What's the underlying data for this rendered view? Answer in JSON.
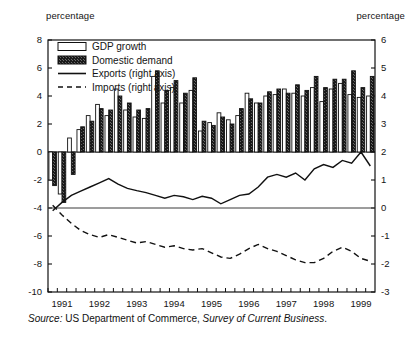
{
  "labels": {
    "unit_left": "percentage",
    "unit_right": "percentage",
    "source_prefix": "Source:",
    "source_body": " US Department of Commerce, ",
    "source_publication": "Survey of Current Business",
    "source_end": "."
  },
  "legend": {
    "items": [
      {
        "label": "GDP growth",
        "marker": "open-bar-swatch"
      },
      {
        "label": "Domestic demand",
        "marker": "filled-bar-swatch"
      },
      {
        "label": "Exports (right axis)",
        "marker": "solid-line-swatch"
      },
      {
        "label": "Imports (right axis)",
        "marker": "dashed-line-swatch"
      }
    ]
  },
  "chart_data": {
    "type": "bar",
    "title": "",
    "xlabel": "",
    "ylabel": "percentage",
    "y2label": "percentage",
    "ylim": [
      -10,
      8
    ],
    "y2lim": [
      -3,
      6
    ],
    "yticks": [
      8,
      6,
      4,
      2,
      0,
      -2,
      -4,
      -6,
      -8,
      -10
    ],
    "y2ticks": [
      6,
      5,
      4,
      3,
      2,
      1,
      0,
      -1,
      -2,
      -3
    ],
    "grid": false,
    "legend_position": "top-left",
    "categories": [
      "1991Q1",
      "1991Q2",
      "1991Q3",
      "1991Q4",
      "1992Q1",
      "1992Q2",
      "1992Q3",
      "1992Q4",
      "1993Q1",
      "1993Q2",
      "1993Q3",
      "1993Q4",
      "1994Q1",
      "1994Q2",
      "1994Q3",
      "1994Q4",
      "1995Q1",
      "1995Q2",
      "1995Q3",
      "1995Q4",
      "1996Q1",
      "1996Q2",
      "1996Q3",
      "1996Q4",
      "1997Q1",
      "1997Q2",
      "1997Q3",
      "1997Q4",
      "1998Q1",
      "1998Q2",
      "1998Q3",
      "1998Q4",
      "1999Q1",
      "1999Q2",
      "1999Q3"
    ],
    "xtick_labels": [
      "1991",
      "1992",
      "1993",
      "1994",
      "1995",
      "1996",
      "1997",
      "1998",
      "1999"
    ],
    "series": [
      {
        "name": "GDP growth",
        "axis": "left",
        "style": "bar-open",
        "values": [
          -2.0,
          -3.0,
          1.0,
          1.6,
          2.6,
          3.4,
          2.6,
          4.5,
          3.0,
          2.5,
          2.4,
          5.4,
          3.5,
          4.6,
          3.5,
          4.4,
          1.5,
          2.1,
          2.8,
          2.3,
          2.6,
          4.2,
          3.5,
          4.0,
          4.1,
          4.5,
          4.2,
          4.0,
          4.6,
          3.6,
          4.5,
          4.9,
          4.1,
          3.9,
          4.0
        ]
      },
      {
        "name": "Domestic demand",
        "axis": "left",
        "style": "bar-filled",
        "values": [
          -2.4,
          -3.6,
          -1.6,
          1.8,
          2.2,
          3.1,
          3.0,
          4.0,
          3.5,
          3.0,
          3.1,
          5.8,
          4.4,
          5.1,
          4.2,
          5.3,
          2.2,
          1.9,
          2.5,
          2.0,
          3.1,
          3.8,
          3.5,
          4.3,
          4.5,
          4.2,
          4.8,
          4.4,
          5.4,
          4.6,
          5.2,
          5.2,
          5.8,
          4.6,
          5.4
        ]
      },
      {
        "name": "Exports (right axis)",
        "axis": "right",
        "style": "line-solid",
        "values": [
          -0.1,
          0.2,
          0.45,
          0.6,
          0.75,
          0.9,
          1.05,
          0.85,
          0.7,
          0.62,
          0.55,
          0.45,
          0.35,
          0.45,
          0.4,
          0.3,
          0.42,
          0.35,
          0.15,
          0.3,
          0.45,
          0.5,
          0.75,
          1.1,
          1.2,
          1.1,
          1.25,
          1.0,
          1.4,
          1.55,
          1.45,
          1.7,
          1.6,
          2.0,
          1.5
        ]
      },
      {
        "name": "Imports (right axis)",
        "axis": "right",
        "style": "line-dashed",
        "values": [
          0.1,
          -0.25,
          -0.55,
          -0.8,
          -0.95,
          -1.05,
          -0.95,
          -1.05,
          -1.15,
          -1.25,
          -1.2,
          -1.3,
          -1.4,
          -1.35,
          -1.45,
          -1.5,
          -1.45,
          -1.6,
          -1.75,
          -1.8,
          -1.65,
          -1.45,
          -1.3,
          -1.45,
          -1.55,
          -1.7,
          -1.85,
          -1.95,
          -1.95,
          -1.8,
          -1.55,
          -1.4,
          -1.55,
          -1.8,
          -1.9
        ]
      }
    ]
  }
}
